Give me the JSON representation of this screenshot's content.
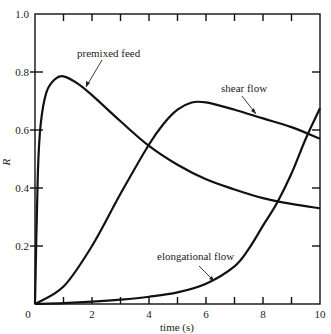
{
  "chart_data": {
    "type": "line",
    "title": "",
    "xlabel": "time (s)",
    "ylabel": "R",
    "xlim": [
      0,
      10
    ],
    "ylim": [
      0,
      1.0
    ],
    "xticks": [
      "0",
      "2",
      "4",
      "6",
      "8",
      "10"
    ],
    "yticks": [
      "0.2",
      "0.4",
      "0.6",
      "0.8",
      "1.0"
    ],
    "grid": false,
    "legend": "inline annotations with arrows",
    "series": [
      {
        "name": "premixed feed",
        "x": [
          0,
          0.1,
          0.2,
          0.4,
          0.7,
          1.0,
          1.5,
          2,
          3,
          4,
          5,
          6,
          7,
          8,
          9,
          10
        ],
        "y": [
          0,
          0.45,
          0.62,
          0.73,
          0.775,
          0.785,
          0.76,
          0.72,
          0.63,
          0.545,
          0.48,
          0.43,
          0.395,
          0.365,
          0.345,
          0.33
        ]
      },
      {
        "name": "shear flow",
        "x": [
          0,
          1,
          2,
          3,
          4,
          4.5,
          5,
          5.5,
          6,
          7,
          8,
          9,
          10
        ],
        "y": [
          0,
          0.06,
          0.2,
          0.38,
          0.55,
          0.62,
          0.67,
          0.695,
          0.695,
          0.67,
          0.64,
          0.61,
          0.57
        ]
      },
      {
        "name": "elongational flow",
        "x": [
          0,
          1,
          2,
          3,
          4,
          5,
          6,
          7,
          7.5,
          8,
          8.5,
          9,
          9.5,
          10
        ],
        "y": [
          0,
          0.003,
          0.008,
          0.015,
          0.025,
          0.04,
          0.07,
          0.13,
          0.19,
          0.27,
          0.35,
          0.45,
          0.57,
          0.675
        ]
      }
    ],
    "annotations": [
      "premixed feed",
      "shear flow",
      "elongational flow"
    ]
  },
  "axes": {
    "xlabel": "time (s)",
    "ylabel": "R",
    "xticks": [
      "0",
      "2",
      "4",
      "6",
      "8",
      "10"
    ],
    "yticks": [
      "0.2",
      "0.4",
      "0.6",
      "0.8",
      "1.0"
    ]
  },
  "labels": {
    "premixed": "premixed feed",
    "shear": "shear flow",
    "elongational": "elongational flow"
  }
}
